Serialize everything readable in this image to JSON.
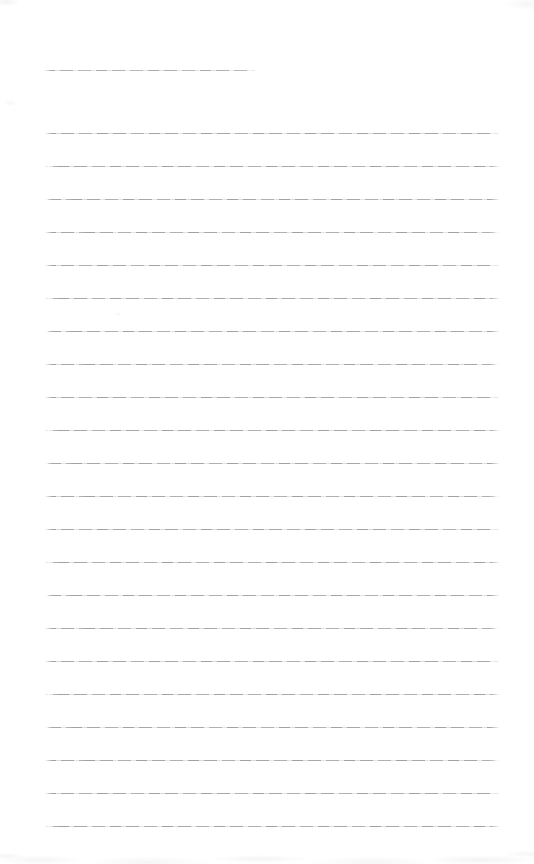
{
  "page": {
    "type": "blank-lined-notebook-page",
    "background_color": "#ffffff",
    "rule_color": "#b4b6b6",
    "title_line": {
      "x": 44,
      "y": 70,
      "width": 212
    },
    "ruled_lines": {
      "x": 45,
      "first_y": 133,
      "spacing": 33,
      "count": 22,
      "width": 455
    },
    "text_content": ""
  }
}
